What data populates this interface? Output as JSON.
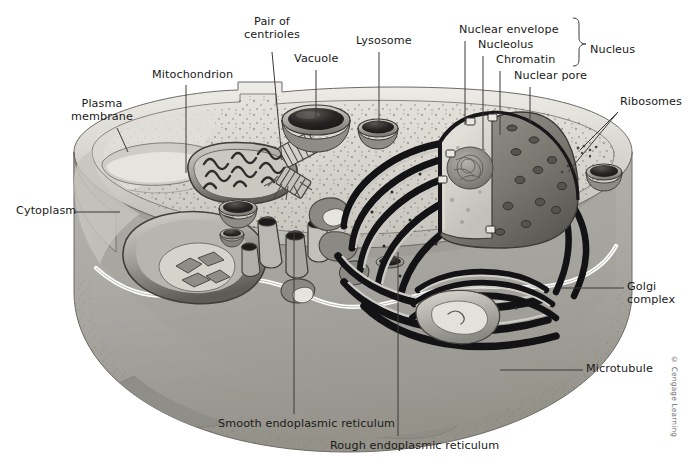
{
  "figure": {
    "credit": "© Cengage Learning",
    "background": "#ffffff",
    "line_color": "#3a3a3a",
    "text_color": "#1a1a1a"
  },
  "bracket": {
    "label": "Nucleus",
    "members": [
      "Nuclear envelope",
      "Nucleolus",
      "Chromatin",
      "Nuclear pore"
    ]
  },
  "labels": [
    {
      "id": "plasma-membrane",
      "text": "Plasma\nmembrane",
      "x": 86,
      "y": 98,
      "align": "center"
    },
    {
      "id": "mitochondrion",
      "text": "Mitochondrion",
      "x": 152,
      "y": 69,
      "align": "left"
    },
    {
      "id": "pair-of-centrioles",
      "text": "Pair of\ncentrioles",
      "x": 248,
      "y": 16,
      "align": "center"
    },
    {
      "id": "vacuole",
      "text": "Vacuole",
      "x": 294,
      "y": 53,
      "align": "left"
    },
    {
      "id": "lysosome",
      "text": "Lysosome",
      "x": 356,
      "y": 35,
      "align": "left"
    },
    {
      "id": "nuclear-envelope",
      "text": "Nuclear envelope",
      "x": 459,
      "y": 24,
      "align": "left"
    },
    {
      "id": "nucleolus",
      "text": "Nucleolus",
      "x": 478,
      "y": 39,
      "align": "left"
    },
    {
      "id": "chromatin",
      "text": "Chromatin",
      "x": 496,
      "y": 54,
      "align": "left"
    },
    {
      "id": "nuclear-pore",
      "text": "Nuclear pore",
      "x": 514,
      "y": 70,
      "align": "left"
    },
    {
      "id": "nucleus",
      "text": "Nucleus",
      "x": 590,
      "y": 44,
      "align": "left"
    },
    {
      "id": "ribosomes",
      "text": "Ribosomes",
      "x": 620,
      "y": 96,
      "align": "left"
    },
    {
      "id": "cytoplasm",
      "text": "Cytoplasm",
      "x": 16,
      "y": 205,
      "align": "left"
    },
    {
      "id": "golgi-complex",
      "text": "Golgi\ncomplex",
      "x": 627,
      "y": 281,
      "align": "left"
    },
    {
      "id": "microtubule",
      "text": "Microtubule",
      "x": 586,
      "y": 363,
      "align": "left"
    },
    {
      "id": "smooth-er",
      "text": "Smooth endoplasmic reticulum",
      "x": 218,
      "y": 418,
      "align": "left"
    },
    {
      "id": "rough-er",
      "text": "Rough endoplasmic reticulum",
      "x": 330,
      "y": 440,
      "align": "left"
    }
  ],
  "structures": [
    "plasma membrane",
    "cytoplasm",
    "mitochondrion",
    "pair of centrioles",
    "vacuole",
    "lysosome",
    "nucleus",
    "nuclear envelope",
    "nucleolus",
    "chromatin",
    "nuclear pore",
    "ribosomes",
    "golgi complex",
    "microtubule",
    "smooth endoplasmic reticulum",
    "rough endoplasmic reticulum"
  ],
  "palette": {
    "cell_top": "#d9d6cf",
    "cell_body": "#a9a7a2",
    "cell_body_dark": "#8f8d88",
    "cytosol_light": "#e2e0da",
    "organelle_mid": "#9b9892",
    "organelle_dark": "#4a4945",
    "er_dark": "#17171a",
    "membrane_white": "#ffffff",
    "nucleus_shell": "#807d77",
    "nucleoplasm": "#cfccc5"
  }
}
